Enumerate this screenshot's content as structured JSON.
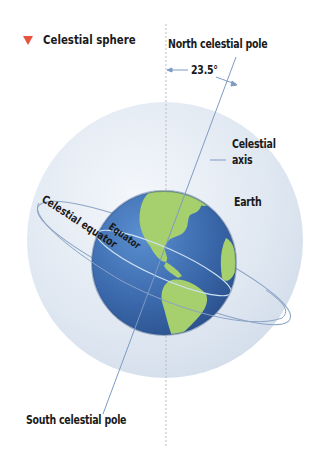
{
  "title": {
    "marker_icon": "red-triangle-down-icon",
    "text": "Celestial sphere"
  },
  "labels": {
    "north_pole": "North celestial pole",
    "angle": "23.5°",
    "axis_line1": "Celestial",
    "axis_line2": "axis",
    "earth": "Earth",
    "celestial_equator": "Celestial equator",
    "equator": "Equator",
    "south_pole": "South celestial pole"
  },
  "colors": {
    "marker": "#e8533f",
    "sphere_fill": "#dfe8f2",
    "ocean": "#3d6fb3",
    "land": "#a6cf6e",
    "lines": "#7d9bc4",
    "text": "#1a1a1a"
  }
}
